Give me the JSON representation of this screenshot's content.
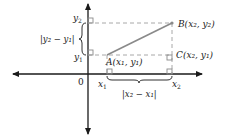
{
  "figure": {
    "colors": {
      "axis": "#1a1a1a",
      "segment": "#8a8a8a",
      "dashed": "#a8a8a8",
      "text": "#222222"
    }
  },
  "labels": {
    "origin": "0",
    "x1": "x",
    "x1_sub": "1",
    "x2": "x",
    "x2_sub": "2",
    "y1": "y",
    "y1_sub": "1",
    "y2": "y",
    "y2_sub": "2",
    "point_a": "A(x₁, y₁)",
    "point_b": "B(x₂, y₂)",
    "point_c": "C(x₂, y₁)",
    "vertical_distance": "|y₂ − y₁|",
    "horizontal_distance": "|x₂ − x₁|"
  },
  "points": {
    "A": {
      "name": "A",
      "coords": "(x1, y1)"
    },
    "B": {
      "name": "B",
      "coords": "(x2, y2)"
    },
    "C": {
      "name": "C",
      "coords": "(x2, y1)"
    }
  }
}
